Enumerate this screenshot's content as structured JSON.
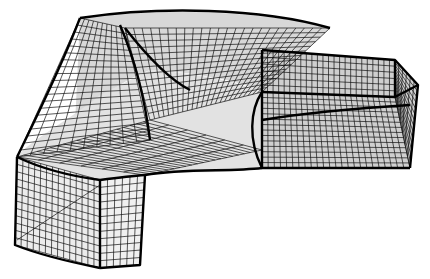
{
  "figure": {
    "title": "",
    "colors": {
      "background": "#ffffff",
      "mesh": "#111111",
      "edges": "#000000"
    },
    "mesh_density": {
      "inlet_columns": 14,
      "inlet_rows": 12,
      "body_lines": 40,
      "outlet_lines": 24
    }
  }
}
